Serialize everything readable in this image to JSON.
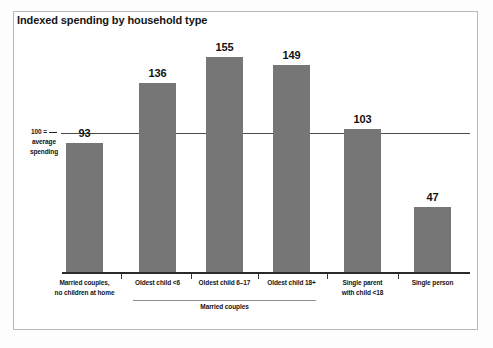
{
  "figure": {
    "title": "Indexed spending by household type",
    "frame_color": "#b9b9b9",
    "background": "#ffffff"
  },
  "annotation": {
    "reference_line_1": "100 =",
    "reference_line_2": "average",
    "reference_line_3": "spending",
    "reference_value": 100
  },
  "group_bracket": {
    "label": "Married couples",
    "spans_categories": [
      1,
      2,
      3
    ]
  },
  "chart_data": {
    "type": "bar",
    "title": "Indexed spending by household type",
    "xlabel": "",
    "ylabel": "",
    "categories": [
      "Married couples, no children at home",
      "Oldest child <6",
      "Oldest child 6–17",
      "Oldest child 18+",
      "Single parent with child <18",
      "Single person"
    ],
    "category_lines": [
      [
        "Married couples,",
        "no children at home"
      ],
      [
        "Oldest child <6"
      ],
      [
        "Oldest child 6–17"
      ],
      [
        "Oldest child 18+"
      ],
      [
        "Single parent",
        "with child <18"
      ],
      [
        "Single person"
      ]
    ],
    "values": [
      93,
      136,
      155,
      149,
      103,
      47
    ],
    "ylim": [
      0,
      160
    ],
    "grid": false,
    "legend": false,
    "reference_line": 100,
    "reference_line_label": "100 = average spending",
    "bar_color": "#767676",
    "data_labels": [
      "93",
      "136",
      "155",
      "149",
      "103",
      "47"
    ]
  }
}
